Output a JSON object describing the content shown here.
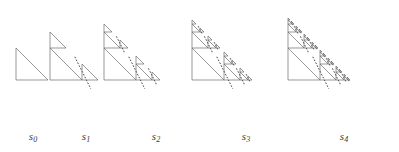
{
  "figure": {
    "background_color": "#ffffff",
    "line_color": "#6b6b6b",
    "dash_color": "#2b2b2b",
    "label_color": "#3a3a3a",
    "width": 399,
    "height": 152
  },
  "stages": [
    {
      "label": "s",
      "subscript": "0",
      "depth": 0,
      "label_x": 33,
      "label_y": 130,
      "origin_x": 16,
      "origin_y": 80,
      "size": 32
    },
    {
      "label": "s",
      "subscript": "1",
      "depth": 1,
      "label_x": 86,
      "label_y": 130,
      "origin_x": 50,
      "origin_y": 80,
      "size": 32
    },
    {
      "label": "s",
      "subscript": "2",
      "depth": 2,
      "label_x": 156,
      "label_y": 130,
      "origin_x": 104,
      "origin_y": 80,
      "size": 32
    },
    {
      "label": "s",
      "subscript": "3",
      "depth": 3,
      "label_x": 246,
      "label_y": 130,
      "origin_x": 192,
      "origin_y": 80,
      "size": 32
    },
    {
      "label": "s",
      "subscript": "4",
      "depth": 4,
      "label_x": 344,
      "label_y": 130,
      "origin_x": 288,
      "origin_y": 80,
      "size": 32
    }
  ],
  "geometry": {
    "triangle_description": "right triangle: apex top-left, right angle bottom-left, bottom-right vertex",
    "child_top_offset": "half-scale copy placed at top of vertical leg",
    "child_bottom_right_offset": "half-scale copy placed at bottom-right vertex",
    "dashed_line": "dashed segment parallel to hypotenuse, offset outward",
    "stroke_width": 0.7,
    "dash_pattern": "1.6 1.6"
  }
}
